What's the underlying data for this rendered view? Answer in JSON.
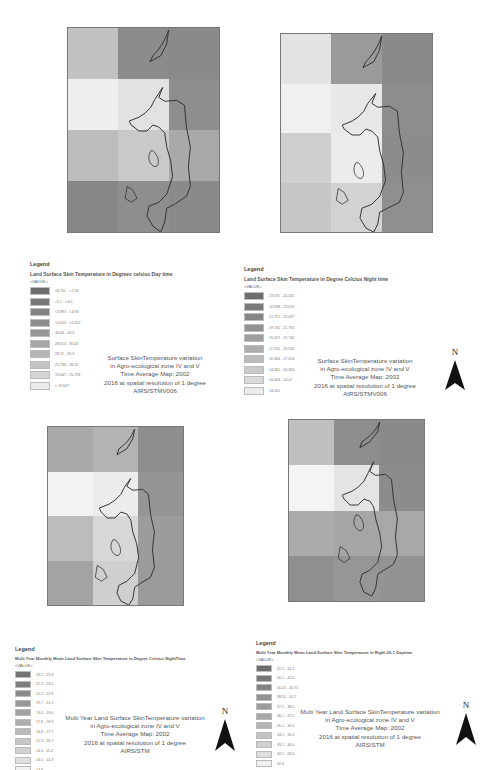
{
  "panels": [
    {
      "id": "day-2002",
      "map": {
        "cells": [
          "#c2c2c2",
          "#8c8c8c",
          "#8a8a8a",
          "#eeeeee",
          "#e2e2e2",
          "#8e8e8e",
          "#bdbdbd",
          "#c9c9c9",
          "#a9a9a9",
          "#868686",
          "#8e8e8e",
          "#8a8a8a"
        ],
        "labels": [
          "Mur",
          "Lma",
          "Mlo",
          "Lma",
          "Kwa",
          "Lkwa",
          "Aa8",
          "Lma",
          "Lm8",
          "Lm7"
        ]
      },
      "legend": {
        "heading": "Legend",
        "title": "Land Surface Skin Temperature in Degrees celsius Day time",
        "value_label": "<VALUE>",
        "items": [
          {
            "color": "#6e6e6e",
            "range": "<8.751 - <7.16"
          },
          {
            "color": "#787878",
            "range": "<5.1 - <4.5"
          },
          {
            "color": "#828282",
            "range": "<3.887 - <3.93"
          },
          {
            "color": "#8c8c8c",
            "range": "<0.613 - <1.647"
          },
          {
            "color": "#989898",
            "range": "30.64 - 40.3"
          },
          {
            "color": "#a6a6a6",
            "range": "28.613 - 30.63"
          },
          {
            "color": "#b4b4b4",
            "range": "28.21 - 29.3"
          },
          {
            "color": "#c4c4c4",
            "range": "25.734 - 28.20"
          },
          {
            "color": "#d4d4d4",
            "range": "19.647 - 25.733"
          },
          {
            "color": "#eaeaea",
            "range": "< 19.647"
          }
        ]
      },
      "caption": [
        "Surface SkinTemperature  variation",
        "in Agro-ecological zone IV and V",
        "Time Average  Map: 2002",
        "2016 at spatial resolution of 1 degree",
        "AIRS/STMV006"
      ]
    },
    {
      "id": "night-2002",
      "map": {
        "cells": [
          "#e3e3e3",
          "#9a9a9a",
          "#8a8a8a",
          "#f0f0f0",
          "#e8e8e8",
          "#8d8d8d",
          "#cfcfcf",
          "#ececec",
          "#8c8c8c",
          "#c6c6c6",
          "#d2d2d2",
          "#8f8f8f"
        ],
        "labels": [
          "Mur",
          "Tlid",
          "Lmd",
          "Lma",
          "Kwa",
          "Lkwa",
          "Aa8",
          "Lma",
          "Lm6"
        ]
      },
      "legend": {
        "heading": "Legend",
        "title": "Land Surface Skin Temperature in Degree Celcius Night time",
        "value_label": "<VALUE>",
        "items": [
          {
            "color": "#6e6e6e",
            "range": "23.071 - 24.425"
          },
          {
            "color": "#7a7a7a",
            "range": "22.098 - 23.070"
          },
          {
            "color": "#868686",
            "range": "21.751 - 22.097"
          },
          {
            "color": "#929292",
            "range": "19.741 - 21.750"
          },
          {
            "color": "#9e9e9e",
            "range": "19.207 - 19.740"
          },
          {
            "color": "#acacac",
            "range": "17.055 - 19.206"
          },
          {
            "color": "#bababa",
            "range": "16.364 - 17.054"
          },
          {
            "color": "#cacaca",
            "range": "14.461 - 16.363"
          },
          {
            "color": "#dadada",
            "range": "14.003 - 14.47"
          },
          {
            "color": "#ececec",
            "range": "14.002"
          }
        ]
      },
      "caption": [
        "Surface SkinTemperature  variation",
        "in Agro-ecological zone IV and V",
        "Time Average  Map: 2002",
        "2016 at spatial resolution of 1 degree",
        "AIRS/STMV006"
      ]
    },
    {
      "id": "multi-year-night",
      "map": {
        "cells": [
          "#a9a9a9",
          "#b3b3b3",
          "#8e8e8e",
          "#f2f2f2",
          "#ececec",
          "#959595",
          "#bcbcbc",
          "#d7d7d7",
          "#9c9c9c",
          "#a3a3a3",
          "#cfcfcf",
          "#9a9a9a"
        ],
        "labels": [
          "Mur",
          "Tlid",
          "Lmd",
          "Lma",
          "Kwa",
          "Lkwa",
          "Aa8",
          "Lma",
          "Lm6"
        ]
      },
      "legend": {
        "heading": "Legend",
        "title": "Multi Year Monthly Mean Land Surface Skin Temperature in Degree Celsius NightTime",
        "value_label": "<VALUE>",
        "items": [
          {
            "color": "#727272",
            "range": "23.1 - 23.4"
          },
          {
            "color": "#7e7e7e",
            "range": "21.9 - 23.0"
          },
          {
            "color": "#8a8a8a",
            "range": "21.2 - 21.8"
          },
          {
            "color": "#969696",
            "range": "19.7 - 21.1"
          },
          {
            "color": "#a2a2a2",
            "range": "19.0 - 19.6"
          },
          {
            "color": "#aeaeae",
            "range": "17.8 - 18.9"
          },
          {
            "color": "#bababa",
            "range": "16.8 - 17.7"
          },
          {
            "color": "#c6c6c6",
            "range": "15.3 - 16.7"
          },
          {
            "color": "#d2d2d2",
            "range": "14.4 - 15.2"
          },
          {
            "color": "#e0e0e0",
            "range": "14.0 - 14.3"
          },
          {
            "color": "#f0f0f0",
            "range": "13.9"
          }
        ]
      },
      "caption": [
        "Multi Year Land Surface SkinTemperature  variation",
        "in Agro-ecological zone IV and V",
        "Time Average  Map: 2002",
        "2016 at spatial resolution of 1 degree",
        "AIRS/STM"
      ]
    },
    {
      "id": "multi-year-day",
      "map": {
        "cells": [
          "#bfbfbf",
          "#8d8d8d",
          "#8a8a8a",
          "#f4f4f4",
          "#e4e4e4",
          "#8c8c8c",
          "#ababab",
          "#a6a6a6",
          "#a8a8a8",
          "#8f8f8f",
          "#969696",
          "#939393"
        ],
        "labels": [
          "Mur",
          "Tlid",
          "Lmd",
          "Lma",
          "Kwa",
          "Lkwa",
          "Aa8",
          "Lma",
          "Lm6"
        ]
      },
      "legend": {
        "heading": "Legend",
        "title": "Multi Year Monthly Mean Land Surface Skin Temperature in Right 25-1 Daytime",
        "value_label": "<VALUE>",
        "items": [
          {
            "color": "#6c6c6c",
            "range": "41.1 - 41.5"
          },
          {
            "color": "#787878",
            "range": "40.1 - 41.0"
          },
          {
            "color": "#848484",
            "range": "40.21 - 40.75"
          },
          {
            "color": "#909090",
            "range": "38.51 - 40.2"
          },
          {
            "color": "#9c9c9c",
            "range": "37.1 - 38.5"
          },
          {
            "color": "#a8a8a8",
            "range": "36.1 - 37.0"
          },
          {
            "color": "#b4b4b4",
            "range": "35.1 - 36.0"
          },
          {
            "color": "#c2c2c2",
            "range": "34.1 - 35.0"
          },
          {
            "color": "#d0d0d0",
            "range": "33.1 - 34.0"
          },
          {
            "color": "#dedede",
            "range": "32.1 - 33.0"
          },
          {
            "color": "#f0f0f0",
            "range": "32.0"
          }
        ]
      },
      "caption": [
        "Multi Year Land Surface SkinTemperature  variation",
        "in Agro-ecological zone IV and V",
        "Time Average  Map: 2002",
        "2016 at spatial resolution of 1 degree",
        "AIRS/STM"
      ]
    }
  ],
  "north_arrow": {
    "label": "N"
  }
}
